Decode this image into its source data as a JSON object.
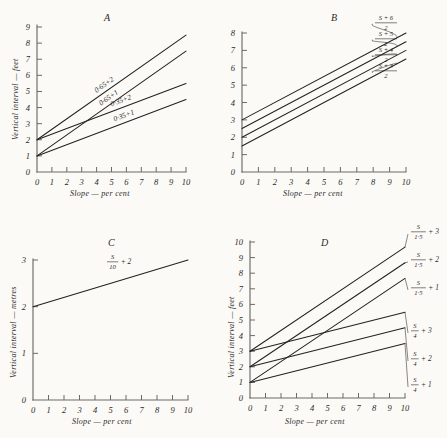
{
  "figure": {
    "background_color": "#fbfaf7",
    "ink_color": "#23221f",
    "axis_color": "#6b6a66"
  },
  "common": {
    "xlabel": "Slope — per cent",
    "ylabel_feet": "Vertical interval — feet",
    "ylabel_metres": "Vertical interval — metres",
    "x_ticks": [
      "0",
      "1",
      "2",
      "3",
      "4",
      "5",
      "6",
      "7",
      "8",
      "9",
      "10"
    ]
  },
  "panels": [
    {
      "letter": "A",
      "y_ticks": [
        "0",
        "1",
        "2",
        "3",
        "4",
        "5",
        "6",
        "7",
        "8",
        "9"
      ],
      "labels": [
        "0·65+2",
        "0·65+1",
        "0·35+2",
        "0·35+1"
      ]
    },
    {
      "letter": "B",
      "y_ticks": [
        "0",
        "1",
        "2",
        "3",
        "4",
        "5",
        "6",
        "7",
        "8"
      ],
      "labels": [
        {
          "num": "S + 6",
          "den": "2"
        },
        {
          "num": "S + 5",
          "den": "2"
        },
        {
          "num": "S + 4",
          "den": "2"
        },
        {
          "num": "S + 3",
          "den": "2"
        }
      ]
    },
    {
      "letter": "C",
      "y_ticks": [
        "0",
        "1",
        "2",
        "3"
      ],
      "label": {
        "num": "S",
        "den": "10",
        "suffix": "+ 2"
      }
    },
    {
      "letter": "D",
      "y_ticks": [
        "0",
        "1",
        "2",
        "3",
        "4",
        "5",
        "6",
        "7",
        "8",
        "9",
        "10"
      ],
      "labels": [
        {
          "num": "S",
          "den": "1·5",
          "suffix": "+ 3"
        },
        {
          "num": "S",
          "den": "1·5",
          "suffix": "+ 2"
        },
        {
          "num": "S",
          "den": "1·5",
          "suffix": "+ 1"
        },
        {
          "num": "S",
          "den": "4",
          "suffix": "+ 3"
        },
        {
          "num": "S",
          "den": "4",
          "suffix": "+ 2"
        },
        {
          "num": "S",
          "den": "4",
          "suffix": "+ 1"
        }
      ]
    }
  ],
  "chart_data": [
    {
      "type": "line",
      "title": "A",
      "xlabel": "Slope — per cent",
      "ylabel": "Vertical interval — feet",
      "xlim": [
        0,
        10
      ],
      "ylim": [
        0,
        9
      ],
      "grid": false,
      "legend": "inline-annotations",
      "x": [
        0,
        10
      ],
      "series": [
        {
          "name": "0·65+2",
          "intercept": 2,
          "slope": 0.65,
          "values": [
            2,
            8.5
          ]
        },
        {
          "name": "0·65+1",
          "intercept": 1,
          "slope": 0.65,
          "values": [
            1,
            7.5
          ]
        },
        {
          "name": "0·35+2",
          "intercept": 2,
          "slope": 0.35,
          "values": [
            2,
            5.5
          ]
        },
        {
          "name": "0·35+1",
          "intercept": 1,
          "slope": 0.35,
          "values": [
            1,
            4.5
          ]
        }
      ]
    },
    {
      "type": "line",
      "title": "B",
      "xlabel": "Slope — per cent",
      "ylabel": "Vertical interval — feet",
      "xlim": [
        0,
        10
      ],
      "ylim": [
        0,
        8
      ],
      "grid": false,
      "legend": "inline-annotations",
      "x": [
        0,
        10
      ],
      "series": [
        {
          "name": "(S + 6) / 2",
          "intercept": 3,
          "slope": 0.5,
          "values": [
            3,
            8
          ]
        },
        {
          "name": "(S + 5) / 2",
          "intercept": 2.5,
          "slope": 0.5,
          "values": [
            2.5,
            7.5
          ]
        },
        {
          "name": "(S + 4) / 2",
          "intercept": 2,
          "slope": 0.5,
          "values": [
            2,
            7
          ]
        },
        {
          "name": "(S + 3) / 2",
          "intercept": 1.5,
          "slope": 0.5,
          "values": [
            1.5,
            6.5
          ]
        }
      ]
    },
    {
      "type": "line",
      "title": "C",
      "xlabel": "Slope — per cent",
      "ylabel": "Vertical interval — metres",
      "xlim": [
        0,
        10
      ],
      "ylim": [
        0,
        3
      ],
      "grid": false,
      "legend": "inline-annotations",
      "x": [
        0,
        10
      ],
      "series": [
        {
          "name": "S/10 + 2",
          "intercept": 2,
          "slope": 0.1,
          "values": [
            2,
            3
          ]
        }
      ]
    },
    {
      "type": "line",
      "title": "D",
      "xlabel": "Slope — per cent",
      "ylabel": "Vertical interval — feet",
      "xlim": [
        0,
        10
      ],
      "ylim": [
        0,
        10
      ],
      "grid": false,
      "legend": "inline-annotations",
      "x": [
        0,
        10
      ],
      "series": [
        {
          "name": "S/1·5 + 3",
          "intercept": 3,
          "slope": 0.667,
          "values": [
            3,
            9.67
          ]
        },
        {
          "name": "S/1·5 + 2",
          "intercept": 2,
          "slope": 0.667,
          "values": [
            2,
            8.67
          ]
        },
        {
          "name": "S/1·5 + 1",
          "intercept": 1,
          "slope": 0.667,
          "values": [
            1,
            7.67
          ]
        },
        {
          "name": "S/4 + 3",
          "intercept": 3,
          "slope": 0.25,
          "values": [
            3,
            5.5
          ]
        },
        {
          "name": "S/4 + 2",
          "intercept": 2,
          "slope": 0.25,
          "values": [
            2,
            4.5
          ]
        },
        {
          "name": "S/4 + 1",
          "intercept": 1,
          "slope": 0.25,
          "values": [
            1,
            3.5
          ]
        }
      ]
    }
  ]
}
